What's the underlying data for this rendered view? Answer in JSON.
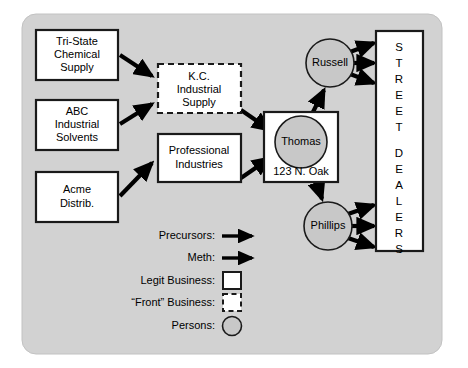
{
  "diagram": {
    "background_color": "#ffffff",
    "panel_color": "#d2d2d2",
    "person_fill": "#c8c8c8",
    "business_fill": "#ffffff",
    "line_color": "#000000",
    "suppliers": [
      {
        "id": "tri-state",
        "lines": [
          "Tri-State",
          "Chemical",
          "Supply"
        ],
        "type": "legit-business"
      },
      {
        "id": "abc",
        "lines": [
          "ABC",
          "Industrial",
          "Solvents"
        ],
        "type": "legit-business"
      },
      {
        "id": "acme",
        "lines": [
          "Acme",
          "Distrib."
        ],
        "type": "legit-business"
      }
    ],
    "fronts": [
      {
        "id": "kc",
        "lines": [
          "K.C.",
          "Industrial",
          "Supply"
        ],
        "type": "front-business"
      }
    ],
    "middle": [
      {
        "id": "professional",
        "lines": [
          "Professional",
          "Industries"
        ],
        "type": "legit-business"
      }
    ],
    "cook": {
      "id": "thomas",
      "name": "Thomas",
      "address": "123 N. Oak",
      "type": "person"
    },
    "distributors": [
      {
        "id": "russell",
        "name": "Russell",
        "type": "person"
      },
      {
        "id": "phillips",
        "name": "Phillips",
        "type": "person"
      }
    ],
    "dealers": {
      "id": "street-dealers",
      "label": "STREET DEALERS",
      "letters_line1": [
        "S",
        "T",
        "R",
        "E",
        "E",
        "T"
      ],
      "letters_line2": [
        "D",
        "E",
        "A",
        "L",
        "E",
        "R",
        "S"
      ]
    },
    "legend": {
      "items": [
        {
          "id": "precursors",
          "label": "Precursors:",
          "symbol": "arrow"
        },
        {
          "id": "meth",
          "label": "Meth:",
          "symbol": "arrow"
        },
        {
          "id": "legit-business",
          "label": "Legit Business:",
          "symbol": "solid-square"
        },
        {
          "id": "front-business",
          "label": "“Front” Business:",
          "symbol": "dashed-square"
        },
        {
          "id": "persons",
          "label": "Persons:",
          "symbol": "circle"
        }
      ]
    }
  }
}
